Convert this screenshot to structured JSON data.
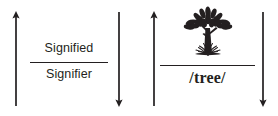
{
  "diagram": {
    "type": "semiotic-sign-diagram",
    "background_color": "#ffffff",
    "ink_color": "#231f20",
    "panels": [
      {
        "id": "signified-signifier",
        "numerator_label": "Signified",
        "denominator_label": "Signifier",
        "numerator_kind": "text",
        "denominator_kind": "text",
        "left_arrow_direction": "up",
        "right_arrow_direction": "down"
      },
      {
        "id": "tree",
        "numerator_label": "",
        "numerator_kind": "image",
        "numerator_icon": "tree-illustration-icon",
        "denominator_label": "/tree/",
        "denominator_kind": "text",
        "left_arrow_direction": "up",
        "right_arrow_direction": "down"
      }
    ]
  }
}
